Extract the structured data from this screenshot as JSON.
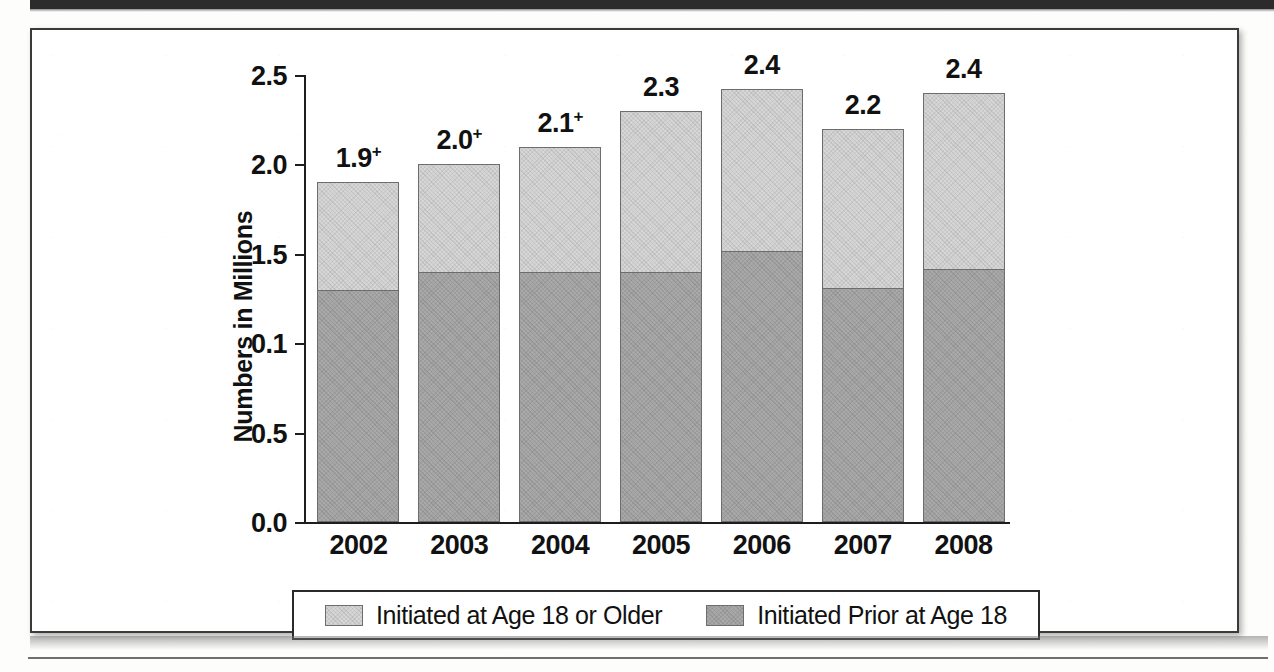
{
  "chart_data": {
    "type": "bar",
    "subtype": "stacked-bar",
    "title": "",
    "xlabel": "",
    "ylabel": "Numbers in Millions",
    "categories": [
      "2002",
      "2003",
      "2004",
      "2005",
      "2006",
      "2007",
      "2008"
    ],
    "ylim": [
      0.0,
      2.5
    ],
    "ytick_labels": [
      "2.5",
      "2.0",
      "1.5",
      "0.1",
      "0.5",
      "0.0"
    ],
    "ytick_values": [
      2.5,
      2.0,
      1.5,
      1.0,
      0.5,
      0.0
    ],
    "grid": false,
    "legend_position": "bottom",
    "series": [
      {
        "name": "Initiated at Age 18 or Older",
        "color": "#d6d6d6",
        "values": [
          0.6,
          0.6,
          0.7,
          0.9,
          0.9,
          0.89,
          0.98
        ]
      },
      {
        "name": "Initiated Prior at Age 18",
        "color": "#a9a9a9",
        "values": [
          1.3,
          1.4,
          1.4,
          1.4,
          1.52,
          1.31,
          1.42
        ]
      }
    ],
    "totals": [
      1.9,
      2.0,
      2.1,
      2.3,
      2.4,
      2.2,
      2.4
    ],
    "total_labels": [
      {
        "text": "1.9",
        "superscript": "+"
      },
      {
        "text": "2.0",
        "superscript": "+"
      },
      {
        "text": "2.1",
        "superscript": "+"
      },
      {
        "text": "2.3",
        "superscript": ""
      },
      {
        "text": "2.4",
        "superscript": ""
      },
      {
        "text": "2.2",
        "superscript": ""
      },
      {
        "text": "2.4",
        "superscript": ""
      }
    ]
  },
  "legend": {
    "items": [
      {
        "label": "Initiated at Age 18 or Older",
        "swatch": "#d6d6d6"
      },
      {
        "label": "Initiated Prior at Age 18",
        "swatch": "#a9a9a9"
      }
    ]
  },
  "axis": {
    "y_title": "Numbers in Millions"
  }
}
